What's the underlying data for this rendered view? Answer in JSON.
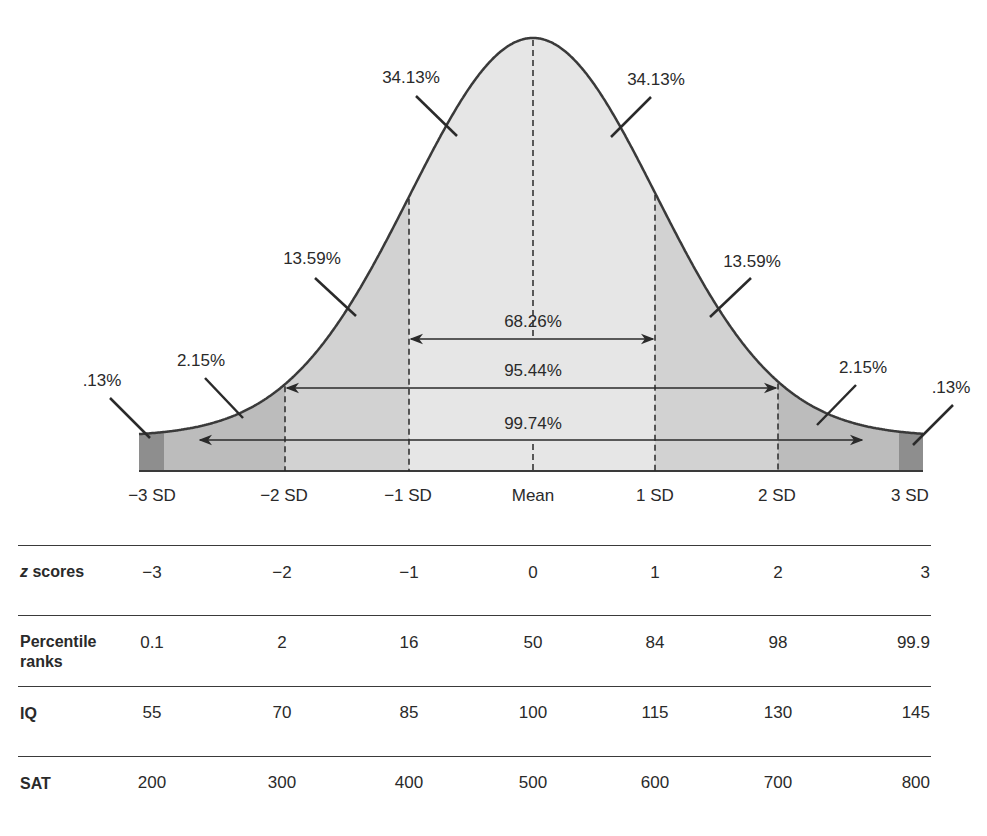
{
  "chart_data": {
    "type": "area",
    "distribution": "normal",
    "x_tick_labels": [
      "−3 SD",
      "−2 SD",
      "−1 SD",
      "Mean",
      "1 SD",
      "2 SD",
      "3 SD"
    ],
    "region_percentages": [
      {
        "region": "beyond -3 SD",
        "value": ".13%"
      },
      {
        "region": "-3 SD to -2 SD",
        "value": "2.15%"
      },
      {
        "region": "-2 SD to -1 SD",
        "value": "13.59%"
      },
      {
        "region": "-1 SD to Mean",
        "value": "34.13%"
      },
      {
        "region": "Mean to 1 SD",
        "value": "34.13%"
      },
      {
        "region": "1 SD to 2 SD",
        "value": "13.59%"
      },
      {
        "region": "2 SD to 3 SD",
        "value": "2.15%"
      },
      {
        "region": "beyond 3 SD",
        "value": ".13%"
      }
    ],
    "spans": [
      {
        "range": "-1 SD to 1 SD",
        "value": "68.26%"
      },
      {
        "range": "-2 SD to 2 SD",
        "value": "95.44%"
      },
      {
        "range": "-3 SD to 3 SD",
        "value": "99.74%"
      }
    ],
    "table": {
      "rows": [
        {
          "label": "z scores",
          "values": [
            "−3",
            "−2",
            "−1",
            "0",
            "1",
            "2",
            "3"
          ]
        },
        {
          "label": "Percentile ranks",
          "values": [
            "0.1",
            "2",
            "16",
            "50",
            "84",
            "98",
            "99.9"
          ]
        },
        {
          "label": "IQ",
          "values": [
            "55",
            "70",
            "85",
            "100",
            "115",
            "130",
            "145"
          ]
        },
        {
          "label": "SAT",
          "values": [
            "200",
            "300",
            "400",
            "500",
            "600",
            "700",
            "800"
          ]
        }
      ]
    },
    "colors": {
      "center": "#e6e6e6",
      "one_to_two": "#d2d2d2",
      "two_to_three": "#bcbcbc",
      "tail": "#8e8e8e",
      "stroke": "#3a3a3a"
    }
  },
  "labels": {
    "pct_tail_left": ".13%",
    "pct_23_left": "2.15%",
    "pct_12_left": "13.59%",
    "pct_01_left": "34.13%",
    "pct_01_right": "34.13%",
    "pct_12_right": "13.59%",
    "pct_23_right": "2.15%",
    "pct_tail_right": ".13%",
    "span_1": "68.26%",
    "span_2": "95.44%",
    "span_3": "99.74%"
  },
  "axis": {
    "sd_m3": "−3 SD",
    "sd_m2": "−2 SD",
    "sd_m1": "−1 SD",
    "mean": "Mean",
    "sd_p1": "1 SD",
    "sd_p2": "2 SD",
    "sd_p3": "3 SD"
  },
  "table": {
    "z_label_z": "z",
    "z_label_rest": " scores",
    "z": [
      "−3",
      "−2",
      "−1",
      "0",
      "1",
      "2",
      "3"
    ],
    "pr_label_1": "Percentile",
    "pr_label_2": "ranks",
    "pr": [
      "0.1",
      "2",
      "16",
      "50",
      "84",
      "98",
      "99.9"
    ],
    "iq_label": "IQ",
    "iq": [
      "55",
      "70",
      "85",
      "100",
      "115",
      "130",
      "145"
    ],
    "sat_label": "SAT",
    "sat": [
      "200",
      "300",
      "400",
      "500",
      "600",
      "700",
      "800"
    ]
  }
}
